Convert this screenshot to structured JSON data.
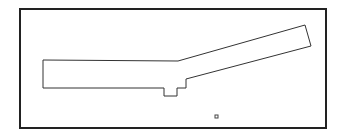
{
  "diagram": {
    "frame": {
      "x": 20,
      "y": 9,
      "width": 306,
      "height": 119,
      "stroke": "#222222",
      "stroke_width": 2
    },
    "outline": {
      "stroke": "#333333",
      "stroke_width": 1,
      "points": [
        [
          43,
          60
        ],
        [
          178,
          61
        ],
        [
          305,
          25
        ],
        [
          311,
          46
        ],
        [
          186,
          79
        ],
        [
          186,
          88
        ],
        [
          177,
          88
        ],
        [
          177,
          96
        ],
        [
          164,
          96
        ],
        [
          164,
          88
        ],
        [
          43,
          88
        ]
      ]
    },
    "marker": {
      "x": 215,
      "y": 115,
      "size": 3,
      "stroke": "#444444"
    }
  }
}
